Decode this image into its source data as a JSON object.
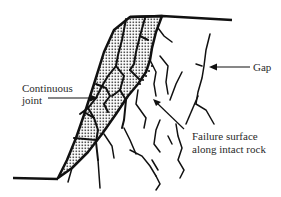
{
  "diagram": {
    "labels": {
      "continuous_joint_line1": "Continuous",
      "continuous_joint_line2": "joint",
      "gap": "Gap",
      "failure_line1": "Failure surface",
      "failure_line2": "along intact rock"
    },
    "colors": {
      "ink": "#111111",
      "label_text": "#2a2a2a",
      "background": "#ffffff"
    }
  }
}
